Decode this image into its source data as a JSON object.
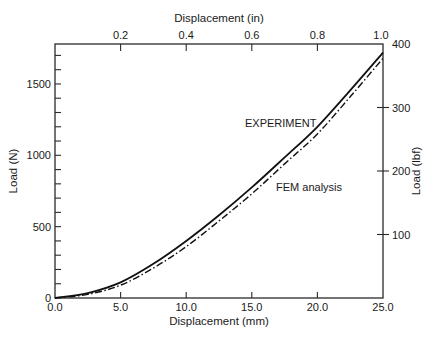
{
  "chart_data": {
    "type": "line",
    "title": "",
    "xlabel": "Displacement (mm)",
    "ylabel": "Load (N)",
    "x2label": "Displacement (in)",
    "y2label": "Load (lbf)",
    "xlim": [
      0,
      25
    ],
    "ylim": [
      0,
      1780
    ],
    "x2lim": [
      0,
      1.0
    ],
    "y2lim": [
      0,
      400
    ],
    "x_ticks": [
      "0.0",
      "5.0",
      "10.0",
      "15.0",
      "20.0",
      "25.0"
    ],
    "y_ticks": [
      "0",
      "500",
      "1000",
      "1500"
    ],
    "x2_ticks": [
      "0.2",
      "0.4",
      "0.6",
      "0.8",
      "1.0"
    ],
    "y2_ticks": [
      "100",
      "200",
      "300",
      "400"
    ],
    "grid": false,
    "legend": "inline annotations",
    "x": [
      0,
      2.5,
      5,
      7.5,
      10,
      12.5,
      15,
      17.5,
      20,
      22.5,
      25
    ],
    "series": [
      {
        "name": "EXPERIMENT",
        "style": "solid",
        "values": [
          0,
          35,
          110,
          240,
          400,
          580,
          775,
          985,
          1200,
          1455,
          1720
        ]
      },
      {
        "name": "FEM analysis",
        "style": "dash-dot",
        "values": [
          0,
          25,
          90,
          210,
          360,
          540,
          730,
          940,
          1150,
          1410,
          1680
        ]
      }
    ],
    "annotations": [
      {
        "text": "EXPERIMENT",
        "x": 14.7,
        "y": 1200
      },
      {
        "text": "FEM analysis",
        "x": 17.2,
        "y": 735
      }
    ]
  }
}
